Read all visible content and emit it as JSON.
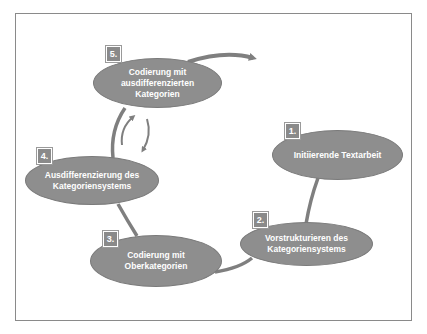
{
  "diagram": {
    "type": "cycle",
    "colors": {
      "node_fill": "#8e8e8e",
      "connector": "#7f7f7f",
      "text": "#ffffff",
      "frame": "#8a8a8a"
    },
    "steps": [
      {
        "number": "1.",
        "label": "Initiierende Textarbeit"
      },
      {
        "number": "2.",
        "label": "Vorstrukturieren des\nKategoriensystems"
      },
      {
        "number": "3.",
        "label": "Codierung mit\nOberkategorien"
      },
      {
        "number": "4.",
        "label": "Ausdifferenzierung des\nKategoriensystems"
      },
      {
        "number": "5.",
        "label": "Codierung mit\nausdifferenzierten\nKategorien"
      }
    ],
    "connectors": [
      {
        "from": "1.",
        "to": "2.",
        "kind": "line"
      },
      {
        "from": "2.",
        "to": "3.",
        "kind": "curve"
      },
      {
        "from": "3.",
        "to": "4.",
        "kind": "line"
      },
      {
        "from": "4.",
        "to": "5.",
        "kind": "curve"
      },
      {
        "from": "5.",
        "to": "exit",
        "kind": "arrow"
      },
      {
        "between": [
          "4.",
          "5."
        ],
        "kind": "bidirectional-curved-arrows"
      }
    ]
  }
}
